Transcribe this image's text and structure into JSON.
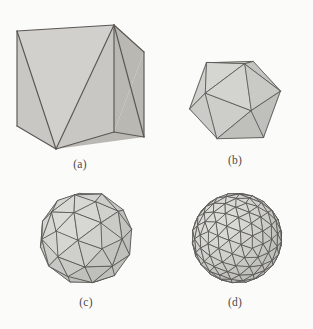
{
  "figure": {
    "background_color": "#fbfbfa",
    "edge_color": "#595754",
    "face_color": "#c9c7c3",
    "face_color_dark": "#bab8b3",
    "face_color_light": "#d2d0cc"
  },
  "panels": [
    {
      "id": "a",
      "caption": "(a)",
      "shape_name": "triangulated-cube",
      "description": "Cube with triangulated visible faces",
      "view": {
        "width": 152,
        "height": 150
      },
      "geometry": {
        "kind": "explicit",
        "vertices": {
          "top_back_left": [
            13,
            25
          ],
          "top_apex": [
            110,
            19
          ],
          "top_right": [
            140,
            46
          ],
          "left_bottom": [
            13,
            120
          ],
          "bottom_front": [
            52,
            143
          ],
          "bottom_right": [
            140,
            131
          ],
          "mid_right_bottom": [
            140,
            46
          ]
        },
        "faces": [
          {
            "name": "left-upper-triangle",
            "points": [
              [
                13,
                25
              ],
              [
                110,
                19
              ],
              [
                52,
                143
              ]
            ],
            "shade": "light"
          },
          {
            "name": "left-lower-triangle",
            "points": [
              [
                13,
                25
              ],
              [
                52,
                143
              ],
              [
                13,
                120
              ]
            ],
            "shade": "base"
          },
          {
            "name": "front-left-triangle",
            "points": [
              [
                110,
                19
              ],
              [
                110,
                126
              ],
              [
                52,
                143
              ]
            ],
            "shade": "base"
          },
          {
            "name": "front-right-triangle",
            "points": [
              [
                110,
                19
              ],
              [
                140,
                46
              ],
              [
                110,
                126
              ]
            ],
            "shade": "dark"
          },
          {
            "name": "right-lower-triangle",
            "points": [
              [
                110,
                126
              ],
              [
                140,
                46
              ],
              [
                140,
                131
              ]
            ],
            "shade": "dark"
          },
          {
            "name": "bottom-sliver",
            "points": [
              [
                52,
                143
              ],
              [
                110,
                126
              ],
              [
                140,
                131
              ]
            ],
            "shade": "dark"
          }
        ],
        "edges": [
          [
            [
              13,
              25
            ],
            [
              110,
              19
            ]
          ],
          [
            [
              110,
              19
            ],
            [
              140,
              46
            ]
          ],
          [
            [
              13,
              25
            ],
            [
              13,
              120
            ]
          ],
          [
            [
              13,
              120
            ],
            [
              52,
              143
            ]
          ],
          [
            [
              52,
              143
            ],
            [
              110,
              126
            ]
          ],
          [
            [
              110,
              126
            ],
            [
              140,
              131
            ]
          ],
          [
            [
              140,
              46
            ],
            [
              140,
              131
            ]
          ],
          [
            [
              110,
              19
            ],
            [
              110,
              126
            ]
          ],
          [
            [
              13,
              25
            ],
            [
              52,
              143
            ]
          ],
          [
            [
              110,
              19
            ],
            [
              52,
              143
            ]
          ],
          [
            [
              110,
              19
            ],
            [
              140,
              131
            ]
          ]
        ]
      }
    },
    {
      "id": "b",
      "caption": "(b)",
      "shape_name": "icosahedron",
      "description": "Regular icosahedron, 20 faces",
      "view": {
        "width": 150,
        "height": 104
      },
      "geometry": {
        "kind": "icosphere",
        "subdivision": 0,
        "radius": 47,
        "center": [
          75,
          52
        ],
        "rotation": {
          "yaw": 21,
          "pitch": -17,
          "roll": 8
        }
      }
    },
    {
      "id": "c",
      "caption": "(c)",
      "shape_name": "geodesic-sphere-frequency-2",
      "description": "Icosahedron after one subdivision, 80 faces",
      "view": {
        "width": 152,
        "height": 110
      },
      "geometry": {
        "kind": "icosphere",
        "subdivision": 1,
        "radius": 47,
        "center": [
          76,
          54
        ],
        "rotation": {
          "yaw": 21,
          "pitch": -17,
          "roll": 8
        }
      }
    },
    {
      "id": "d",
      "caption": "(d)",
      "shape_name": "geodesic-sphere-frequency-4",
      "description": "Icosahedron after two subdivisions, 320 faces",
      "view": {
        "width": 150,
        "height": 110
      },
      "geometry": {
        "kind": "icosphere",
        "subdivision": 2,
        "radius": 45,
        "center": [
          77,
          54
        ],
        "rotation": {
          "yaw": 21,
          "pitch": -17,
          "roll": 8
        }
      }
    }
  ]
}
